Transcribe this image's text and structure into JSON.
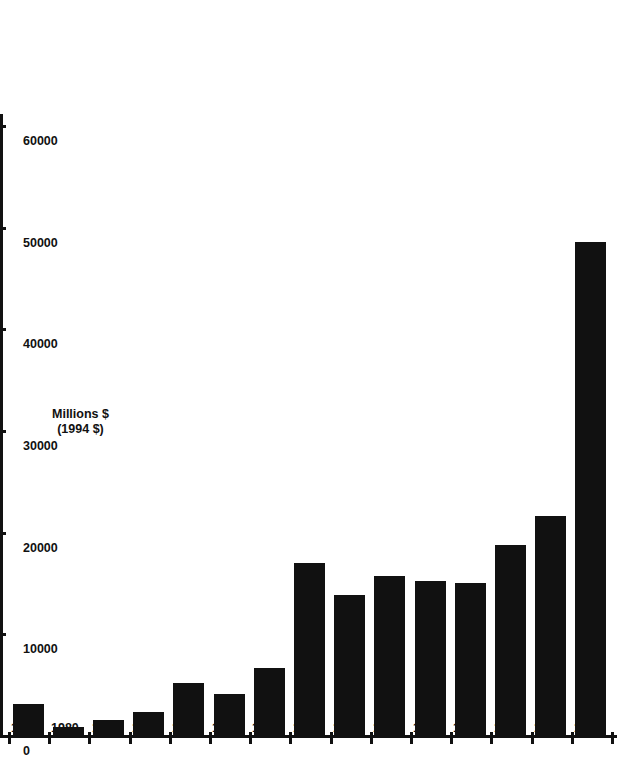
{
  "chart_data": {
    "type": "bar",
    "orientation": "vertical-printed-sideways",
    "title": "",
    "xlabel": "Year",
    "ylabel": "Millions $ (1994 $)",
    "ylabel_lines": [
      "Millions $",
      "(1994 $)"
    ],
    "categories": [
      "1979",
      "1980",
      "1981",
      "1982",
      "1983",
      "1984",
      "1985",
      "1986",
      "1987",
      "1988",
      "1989",
      "1990",
      "1991",
      "1992",
      "1993"
    ],
    "values": [
      3300,
      1100,
      1800,
      2600,
      5400,
      4300,
      6900,
      17200,
      14100,
      15900,
      15400,
      15200,
      19000,
      21800,
      48800
    ],
    "ylim": [
      0,
      60000
    ],
    "ytick_labels": [
      "0",
      "10000",
      "20000",
      "30000",
      "40000",
      "50000",
      "60000"
    ],
    "yticks": [
      0,
      10000,
      20000,
      30000,
      40000,
      50000,
      60000
    ],
    "grid": false,
    "legend": false,
    "legend_position": "none",
    "bar_color": "#111111"
  },
  "axes": {
    "category_axis_title": "Year",
    "value_axis_title_line1": "Millions $",
    "value_axis_title_line2": "(1994 $)"
  }
}
